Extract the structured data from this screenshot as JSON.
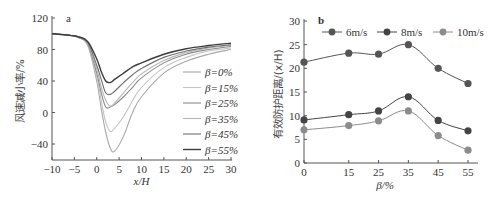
{
  "chart_data": [
    {
      "panel": "a",
      "type": "line",
      "title": "",
      "xlabel": "x/H",
      "ylabel": "风速减小率/%",
      "xlim": [
        -10,
        30
      ],
      "ylim": [
        -50,
        120
      ],
      "xticks": [
        -10,
        -5,
        0,
        5,
        10,
        15,
        20,
        25,
        30
      ],
      "yticks": [
        -40,
        0,
        40,
        80,
        120
      ],
      "grid": false,
      "legend_position": "right-center",
      "x": [
        -10,
        -6,
        -4,
        -2,
        0,
        1,
        2,
        3,
        4,
        6,
        8,
        10,
        15,
        20,
        25,
        30
      ],
      "series": [
        {
          "name": "β=0%",
          "color": "#a8a8a8",
          "values": [
            100,
            98,
            95,
            85,
            40,
            5,
            -25,
            -45,
            -49,
            -30,
            0,
            20,
            50,
            65,
            74,
            80
          ]
        },
        {
          "name": "β=15%",
          "color": "#c4c4c4",
          "values": [
            100,
            98,
            95,
            86,
            45,
            15,
            -12,
            -24,
            -20,
            -5,
            15,
            32,
            57,
            70,
            78,
            82
          ]
        },
        {
          "name": "β=25%",
          "color": "#8a8a8a",
          "values": [
            100,
            98,
            95,
            87,
            50,
            25,
            7,
            7,
            10,
            20,
            32,
            44,
            63,
            74,
            80,
            84
          ]
        },
        {
          "name": "β=35%",
          "color": "#b6b6b6",
          "values": [
            100,
            98,
            96,
            88,
            55,
            32,
            16,
            8,
            12,
            25,
            38,
            49,
            66,
            76,
            82,
            85
          ]
        },
        {
          "name": "β=45%",
          "color": "#6e6e6e",
          "values": [
            100,
            98,
            96,
            89,
            60,
            42,
            25,
            23,
            27,
            38,
            48,
            56,
            70,
            78,
            83,
            86
          ]
        },
        {
          "name": "β=55%",
          "color": "#3c3c3c",
          "values": [
            100,
            98,
            96,
            90,
            68,
            52,
            40,
            38,
            42,
            50,
            58,
            63,
            74,
            81,
            85,
            88
          ]
        }
      ],
      "annotations": [
        "a"
      ]
    },
    {
      "panel": "b",
      "type": "line",
      "title": "",
      "xlabel": "β/%",
      "ylabel": "有效防护距离/(x/H)",
      "xlim": [
        0,
        57
      ],
      "ylim": [
        0,
        30
      ],
      "xticks": [
        0,
        15,
        25,
        35,
        45,
        55
      ],
      "yticks": [
        0,
        5,
        10,
        15,
        20,
        25,
        30
      ],
      "grid": false,
      "legend_position": "top",
      "x": [
        0,
        15,
        25,
        35,
        45,
        55
      ],
      "series": [
        {
          "name": "6m/s",
          "color": "#555555",
          "values": [
            21.3,
            23.2,
            23,
            25,
            20,
            16.8
          ]
        },
        {
          "name": "8m/s",
          "color": "#444444",
          "values": [
            9.1,
            10.2,
            11,
            14,
            9,
            6.8
          ]
        },
        {
          "name": "10m/s",
          "color": "#8c8c8c",
          "values": [
            7,
            7.9,
            8.9,
            11,
            5.8,
            2.7
          ]
        }
      ],
      "annotations": [
        "b"
      ]
    }
  ],
  "labels": {
    "panel_a": "a",
    "panel_b": "b"
  }
}
